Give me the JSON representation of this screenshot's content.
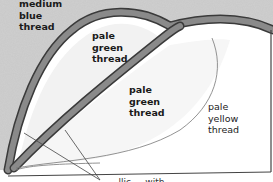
{
  "diagram": {
    "type": "embroidery-stitch-diagram",
    "labels": [
      {
        "id": "medium-blue",
        "text": "medium\nblue\nthread"
      },
      {
        "id": "pale-green-1",
        "text": "pale\ngreen\nthread"
      },
      {
        "id": "pale-green-2",
        "text": "pale\ngreen\nthread"
      },
      {
        "id": "pale-yellow",
        "text": "pale\nyellow\nthread"
      }
    ],
    "caption": "...llic ... with ... ... ...",
    "colors": {
      "band": "#7a7a7a",
      "band_edge": "#3a3a3a",
      "shading": "#d2d2d2",
      "line": "#444444",
      "background": "#ffffff"
    }
  }
}
